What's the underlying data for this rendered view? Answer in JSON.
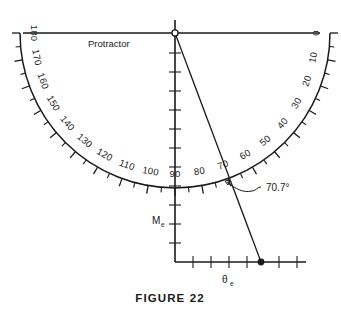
{
  "figure": {
    "caption": "FIGURE 22",
    "protractor_label": "Protractor",
    "angle_annotation": "70.7°",
    "vertical_axis_label": "M",
    "vertical_axis_subscript": "e",
    "horizontal_axis_label": "θ",
    "horizontal_axis_subscript": "e"
  },
  "chart_data": {
    "type": "scatter",
    "title": "FIGURE 22",
    "xlabel": "θe",
    "ylabel": "Me",
    "protractor": {
      "center_x": 175,
      "center_y": 33,
      "radius": 155,
      "span_degrees": [
        0,
        180
      ],
      "tick_interval_degrees": 5,
      "label_interval_degrees": 10,
      "scale_labels": [
        {
          "value": "0",
          "degrees": 0
        },
        {
          "value": "10",
          "degrees": 10
        },
        {
          "value": "20",
          "degrees": 20
        },
        {
          "value": "30",
          "degrees": 30
        },
        {
          "value": "40",
          "degrees": 40
        },
        {
          "value": "50",
          "degrees": 50
        },
        {
          "value": "60",
          "degrees": 60
        },
        {
          "value": "70",
          "degrees": 70
        },
        {
          "value": "80",
          "degrees": 80
        },
        {
          "value": "90",
          "degrees": 90
        },
        {
          "value": "100",
          "degrees": 100
        },
        {
          "value": "110",
          "degrees": 110
        },
        {
          "value": "120",
          "degrees": 120
        },
        {
          "value": "130",
          "degrees": 130
        },
        {
          "value": "140",
          "degrees": 140
        },
        {
          "value": "150",
          "degrees": 150
        },
        {
          "value": "160",
          "degrees": 160
        },
        {
          "value": "170",
          "degrees": 170
        },
        {
          "value": "180",
          "degrees": 180
        }
      ]
    },
    "ray": {
      "angle_degrees": 70.7,
      "origin": [
        175,
        33
      ],
      "endpoint": [
        261,
        262
      ],
      "arc_intersection": [
        222,
        180
      ]
    },
    "axes": {
      "vertical": {
        "x": 175,
        "y_top": 20,
        "y_bottom": 262,
        "tick_count": 12
      },
      "horizontal": {
        "y": 262,
        "x_left": 175,
        "x_right": 306,
        "tick_count": 7
      }
    }
  }
}
